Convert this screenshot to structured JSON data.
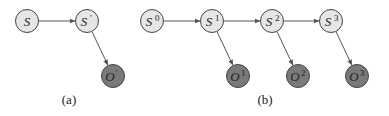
{
  "colors": {
    "state_fill": "#e6e6e6",
    "observation_fill": "#7a7a7a",
    "stroke": "#444444",
    "edge": "#555555"
  },
  "panels": [
    {
      "caption": "(a)",
      "caption_pos": [
        69,
        104
      ],
      "nodes": [
        {
          "id": "S",
          "type": "state",
          "base": "S",
          "sup": "",
          "x": 27,
          "y": 21
        },
        {
          "id": "S'",
          "type": "state",
          "base": "S",
          "sup": "'",
          "x": 87,
          "y": 21
        },
        {
          "id": "O'",
          "type": "observation",
          "base": "O",
          "sup": "'",
          "x": 113,
          "y": 76
        }
      ],
      "edges": [
        {
          "from": "S",
          "to": "S'"
        },
        {
          "from": "S'",
          "to": "O'"
        }
      ]
    },
    {
      "caption": "(b)",
      "caption_pos": [
        265,
        104
      ],
      "nodes": [
        {
          "id": "S0",
          "type": "state",
          "base": "S",
          "sup": "0",
          "x": 152,
          "y": 21
        },
        {
          "id": "S1",
          "type": "state",
          "base": "S",
          "sup": "1",
          "x": 212,
          "y": 21
        },
        {
          "id": "S2",
          "type": "state",
          "base": "S",
          "sup": "2",
          "x": 272,
          "y": 21
        },
        {
          "id": "S3",
          "type": "state",
          "base": "S",
          "sup": "3",
          "x": 331,
          "y": 21
        },
        {
          "id": "O1",
          "type": "observation",
          "base": "O",
          "sup": "1",
          "x": 238,
          "y": 76
        },
        {
          "id": "O2",
          "type": "observation",
          "base": "O",
          "sup": "2",
          "x": 298,
          "y": 76
        },
        {
          "id": "O3",
          "type": "observation",
          "base": "O",
          "sup": "3",
          "x": 357,
          "y": 76
        }
      ],
      "edges": [
        {
          "from": "S0",
          "to": "S1"
        },
        {
          "from": "S1",
          "to": "S2"
        },
        {
          "from": "S2",
          "to": "S3"
        },
        {
          "from": "S1",
          "to": "O1"
        },
        {
          "from": "S2",
          "to": "O2"
        },
        {
          "from": "S3",
          "to": "O3"
        }
      ]
    }
  ],
  "node_radius": 11.5
}
